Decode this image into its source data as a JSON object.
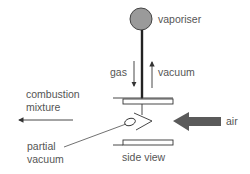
{
  "diagram": {
    "type": "venturi-carburettor-schematic",
    "labels": {
      "vaporiser": "vaporiser",
      "gas": "gas",
      "vacuum": "vacuum",
      "combustion_line1": "combustion",
      "combustion_line2": "mixture",
      "air": "air",
      "partial_line1": "partial",
      "partial_line2": "vacuum",
      "side_view": "side view"
    },
    "colors": {
      "vaporiser_fill": "#9a9a9a",
      "air_arrow": "#5a5a5a",
      "line": "#333333",
      "text": "#555555"
    }
  }
}
